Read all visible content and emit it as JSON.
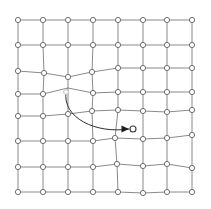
{
  "figure": {
    "type": "mesh-grid-diagram",
    "width": 211,
    "height": 209,
    "background_color": "#ffffff",
    "edge_color": "#8a8a8a",
    "node_fill_color": "#ffffff",
    "node_stroke_color": "#6f6f6f",
    "arrow_color": "#2e2e2e",
    "source_node_color": "#c2c2c2",
    "target_node_color": "#3a3a3a",
    "rows": 8,
    "cols": 8,
    "node_radius": 2.6,
    "source_node_radius": 2.4,
    "target_node_radius": 3.0
  },
  "grid": {
    "rows": 8,
    "cols": 8,
    "node_positions": [
      [
        [
          18,
          20
        ],
        [
          43,
          20
        ],
        [
          68,
          20
        ],
        [
          93,
          20
        ],
        [
          118,
          20
        ],
        [
          143,
          20
        ],
        [
          167,
          20
        ],
        [
          192,
          20
        ]
      ],
      [
        [
          18,
          45
        ],
        [
          43,
          45
        ],
        [
          68,
          45
        ],
        [
          93,
          45
        ],
        [
          118,
          45
        ],
        [
          143,
          45
        ],
        [
          167,
          45
        ],
        [
          192,
          45
        ]
      ],
      [
        [
          18,
          71
        ],
        [
          44,
          73
        ],
        [
          68,
          77
        ],
        [
          92,
          72
        ],
        [
          118,
          68
        ],
        [
          143,
          68
        ],
        [
          167,
          68
        ],
        [
          192,
          68
        ]
      ],
      [
        [
          18,
          94
        ],
        [
          43,
          94
        ],
        [
          68,
          88
        ],
        [
          93,
          93
        ],
        [
          118,
          92
        ],
        [
          143,
          92
        ],
        [
          167,
          92
        ],
        [
          192,
          92
        ]
      ],
      [
        [
          18,
          116
        ],
        [
          43,
          116
        ],
        [
          68,
          114
        ],
        [
          92,
          111
        ],
        [
          118,
          110
        ],
        [
          143,
          111
        ],
        [
          167,
          112
        ],
        [
          192,
          110
        ]
      ],
      [
        [
          18,
          141
        ],
        [
          43,
          141
        ],
        [
          68,
          141
        ],
        [
          93,
          141
        ],
        [
          115,
          138
        ],
        [
          143,
          139
        ],
        [
          167,
          138
        ],
        [
          192,
          135
        ]
      ],
      [
        [
          18,
          167
        ],
        [
          43,
          167
        ],
        [
          68,
          167
        ],
        [
          93,
          167
        ],
        [
          117,
          164
        ],
        [
          143,
          166
        ],
        [
          167,
          164
        ],
        [
          192,
          168
        ]
      ],
      [
        [
          18,
          192
        ],
        [
          43,
          192
        ],
        [
          68,
          192
        ],
        [
          93,
          192
        ],
        [
          118,
          192
        ],
        [
          143,
          193
        ],
        [
          167,
          192
        ],
        [
          192,
          192
        ]
      ]
    ]
  },
  "displacement": {
    "label": "node-displacement-arrow",
    "source_point": [
      66,
      92
    ],
    "target_point": [
      133,
      129
    ],
    "arrowhead_point": [
      129,
      129
    ],
    "control_point_1": [
      62,
      118
    ],
    "control_point_2": [
      96,
      134
    ],
    "arrowhead_size": 5
  },
  "annotations": {
    "source_node_name": "displaced-source-node",
    "target_node_name": "displaced-target-node"
  }
}
